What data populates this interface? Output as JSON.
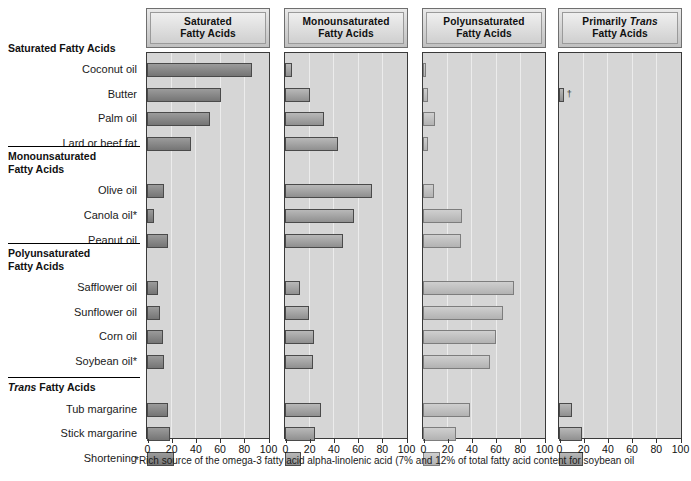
{
  "chart_data": {
    "type": "bar",
    "title": "",
    "orientation": "horizontal",
    "xlabel": "",
    "ylabel": "",
    "xlim": [
      0,
      100
    ],
    "xticks": [
      0,
      20,
      40,
      60,
      80,
      100
    ],
    "grid": true,
    "legend": "none",
    "panels": [
      {
        "id": "saturated",
        "title_line1": "Saturated",
        "title_line2": "Fatty Acids",
        "title_italic_word": ""
      },
      {
        "id": "monounsaturated",
        "title_line1": "Monounsaturated",
        "title_line2": "Fatty Acids",
        "title_italic_word": ""
      },
      {
        "id": "polyunsaturated",
        "title_line1": "Polyunsaturated",
        "title_line2": "Fatty Acids",
        "title_italic_word": ""
      },
      {
        "id": "trans",
        "title_line1": "Primarily ",
        "title_line2": "Fatty Acids",
        "title_italic_word": "Trans"
      }
    ],
    "groups": [
      {
        "heading_line1": "Saturated Fatty Acids",
        "heading_line2": "",
        "heading_italic_word": "",
        "categories": [
          "Coconut oil",
          "Butter",
          "Palm oil",
          "Lard or beef fat"
        ]
      },
      {
        "heading_line1": "Monounsaturated",
        "heading_line2": "Fatty Acids",
        "heading_italic_word": "",
        "categories": [
          "Olive oil",
          "Canola oil*",
          "Peanut oil"
        ]
      },
      {
        "heading_line1": "Polyunsaturated",
        "heading_line2": "Fatty Acids",
        "heading_italic_word": "",
        "categories": [
          "Safflower oil",
          "Sunflower oil",
          "Corn oil",
          "Soybean oil*"
        ]
      },
      {
        "heading_line1": " Fatty Acids",
        "heading_line2": "",
        "heading_italic_word": "Trans",
        "categories": [
          "Tub margarine",
          "Stick margarine",
          "Shortening"
        ]
      }
    ],
    "categories": [
      "Coconut oil",
      "Butter",
      "Palm oil",
      "Lard or beef fat",
      "Olive oil",
      "Canola oil*",
      "Peanut oil",
      "Safflower oil",
      "Sunflower oil",
      "Corn oil",
      "Soybean oil*",
      "Tub margarine",
      "Stick margarine",
      "Shortening"
    ],
    "series": [
      {
        "name": "Saturated Fatty Acids",
        "values": [
          87,
          61,
          52,
          36,
          14,
          6,
          17,
          9,
          11,
          13,
          14,
          17,
          19,
          22
        ]
      },
      {
        "name": "Monounsaturated Fatty Acids",
        "values": [
          6,
          21,
          32,
          44,
          72,
          57,
          48,
          12,
          20,
          24,
          23,
          30,
          25,
          13
        ]
      },
      {
        "name": "Polyunsaturated Fatty Acids",
        "values": [
          2,
          4,
          10,
          4,
          9,
          32,
          31,
          75,
          66,
          60,
          55,
          39,
          27,
          14
        ]
      },
      {
        "name": "Primarily Trans Fatty Acids",
        "values": [
          0,
          4,
          0,
          0,
          0,
          0,
          0,
          0,
          0,
          0,
          0,
          11,
          19,
          20
        ]
      }
    ],
    "annotations": [
      {
        "panel": "trans",
        "category": "Butter",
        "symbol": "†"
      }
    ]
  },
  "footnote": {
    "line1": "*Rich source of the omega-3 fatty acid alpha-linolenic acid (7% and 12% of total fatty acid content for soybean oil"
  }
}
